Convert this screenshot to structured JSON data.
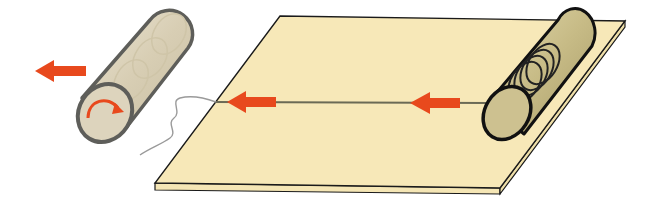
{
  "diagram": {
    "type": "illustration",
    "colors": {
      "board": "#f7e8b8",
      "board_edge": "#1a1a1a",
      "arrow": "#e8491d",
      "strip": "#6b6a55",
      "left_roll": "#d9d0b8",
      "left_roll_outline": "#5e5e5a",
      "right_roll": "#c9bd8a",
      "right_roll_outline": "#111111",
      "thread": "#9a9a9a"
    },
    "elements": [
      {
        "name": "board",
        "label": ""
      },
      {
        "name": "source-roll",
        "label": ""
      },
      {
        "name": "take-up-roller",
        "label": ""
      },
      {
        "name": "pull-arrow-left",
        "direction": "left"
      },
      {
        "name": "strip-arrow-1",
        "direction": "left"
      },
      {
        "name": "strip-arrow-2",
        "direction": "left"
      },
      {
        "name": "rotation-arrow",
        "direction": "clockwise"
      },
      {
        "name": "loose-thread",
        "label": ""
      }
    ]
  }
}
